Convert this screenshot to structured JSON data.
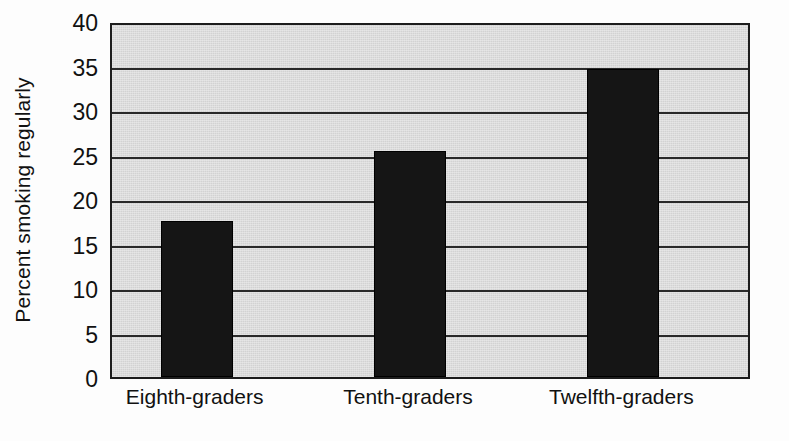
{
  "chart_data": {
    "type": "bar",
    "title": "",
    "subtitle": "",
    "xlabel": "",
    "ylabel": "Percent smoking regularly",
    "categories": [
      "Eighth-graders",
      "Tenth-graders",
      "Twelfth-graders"
    ],
    "values": [
      17.5,
      25.4,
      34.6
    ],
    "series": [
      {
        "name": "Percent smoking regularly",
        "values": [
          17.5,
          25.4,
          34.6
        ]
      }
    ],
    "ylim": [
      0,
      40
    ],
    "ytick_labels": [
      "0",
      "5",
      "10",
      "15",
      "20",
      "25",
      "30",
      "35",
      "40"
    ],
    "ytick_values": [
      0,
      5,
      10,
      15,
      20,
      25,
      30,
      35,
      40
    ],
    "grid": "horizontal",
    "legend": "none",
    "colors": {
      "bar": "#151515",
      "plot_background": "#d2d2d2",
      "gridline": "#2a2a2a",
      "axis": "#1d1d1d",
      "figure_background": "#ffffff",
      "text": "#111111"
    }
  }
}
